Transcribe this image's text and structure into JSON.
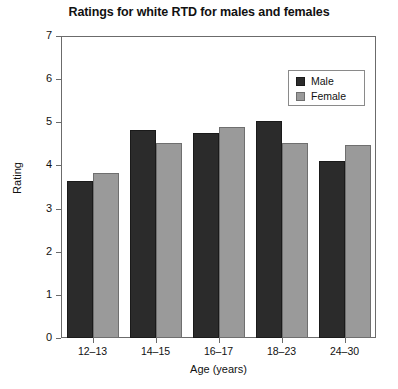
{
  "chart_data": {
    "type": "bar",
    "title": "Ratings for white RTD for males and females",
    "xlabel": "Age (years)",
    "ylabel": "Rating",
    "categories": [
      "12–13",
      "14–15",
      "16–17",
      "18–23",
      "24–30"
    ],
    "series": [
      {
        "name": "Male",
        "values": [
          3.63,
          4.82,
          4.75,
          5.02,
          4.1
        ],
        "color": "#2b2b2b"
      },
      {
        "name": "Female",
        "values": [
          3.83,
          4.51,
          4.88,
          4.52,
          4.48
        ],
        "color": "#9a9a9a"
      }
    ],
    "ylim": [
      0,
      7
    ],
    "yticks": [
      "0",
      "1",
      "2",
      "3",
      "4",
      "5",
      "6",
      "7"
    ],
    "grid": false,
    "legend_position": "upper right",
    "legend_entries": [
      "Male",
      "Female"
    ]
  },
  "axis": {
    "y_title": "Rating",
    "x_title": "Age (years)"
  },
  "legend": {
    "male_label": "Male",
    "female_label": "Female"
  }
}
